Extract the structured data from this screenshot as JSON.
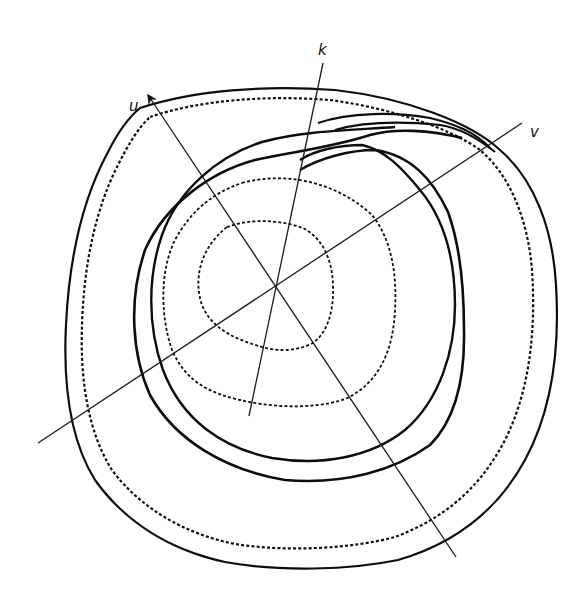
{
  "diagram": {
    "type": "contour-plot-with-axes",
    "center": [
      277,
      290
    ],
    "axes": [
      {
        "name": "u",
        "label": "u",
        "from": [
          456,
          557
        ],
        "to": [
          149,
          96
        ],
        "arrow": true,
        "label_pos": [
          129,
          109
        ]
      },
      {
        "name": "k",
        "label": "k",
        "from": [
          249,
          416
        ],
        "to": [
          323,
          63
        ],
        "arrow": false,
        "label_pos": [
          323,
          53
        ]
      },
      {
        "name": "v",
        "label": "v",
        "from": [
          38,
          443
        ],
        "to": [
          522,
          123
        ],
        "arrow": false,
        "label_pos": [
          531,
          135
        ]
      }
    ],
    "contours": [
      {
        "id": "inner",
        "style": "dotted",
        "weight": 1.8
      },
      {
        "id": "second",
        "style": "dotted",
        "weight": 1.8
      },
      {
        "id": "third",
        "style": "solid",
        "weight": 2.4
      },
      {
        "id": "fourth",
        "style": "solid",
        "weight": 2.6
      },
      {
        "id": "outer-1",
        "style": "dotted",
        "weight": 2.2
      },
      {
        "id": "outer-2",
        "style": "solid",
        "weight": 2.2
      }
    ],
    "colors": {
      "ink": "#0d0d0d",
      "background": "#ffffff"
    }
  }
}
